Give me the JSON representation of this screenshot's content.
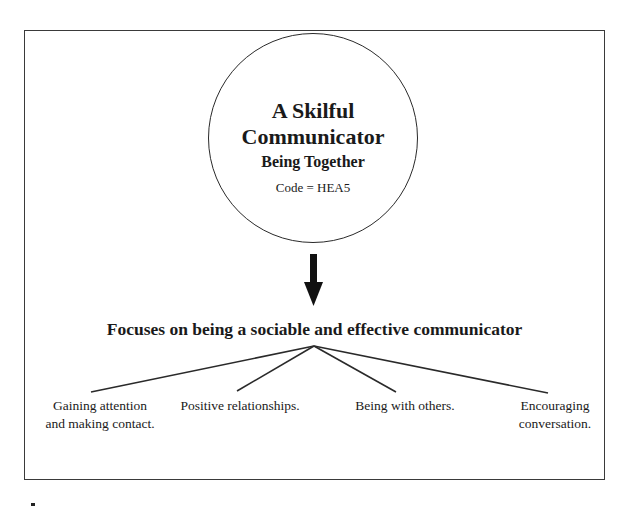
{
  "diagram": {
    "central": {
      "title_line1": "A Skilful",
      "title_line2": "Communicator",
      "subtitle": "Being Together",
      "code": "Code = HEA5"
    },
    "focus": "Focuses on being a sociable and effective communicator",
    "branches": [
      {
        "line1": "Gaining attention",
        "line2": "and making contact."
      },
      {
        "line1": "Positive relationships.",
        "line2": ""
      },
      {
        "line1": "Being with others.",
        "line2": ""
      },
      {
        "line1": "Encouraging",
        "line2": "conversation."
      }
    ],
    "colors": {
      "stroke": "#2a2a2a",
      "text": "#1a1a1a",
      "background": "#ffffff"
    }
  }
}
